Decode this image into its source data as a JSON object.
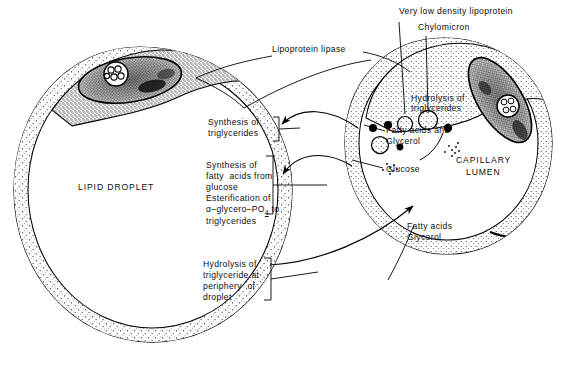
{
  "figure": {
    "title_visible": false,
    "background_color": "#ffffff",
    "ink_color": "#000000"
  },
  "structures": {
    "lipid_droplet": {
      "label": "LIPID DROPLET",
      "description": "adipocyte with large lipid droplet"
    },
    "capillary": {
      "label_line1": "CAPILLARY",
      "label_line2": "LUMEN"
    }
  },
  "callouts": {
    "lipoprotein_lipase": "Lipoprotein lipase",
    "vldl": "Very low density lipoprotein",
    "chylomicron": "Chylomicron",
    "hydrolysis_tg_cap_line1": "Hydrolysis of",
    "hydrolysis_tg_cap_line2": "triglycerides",
    "fatty_acids_and_line1": "Fatty acids and",
    "fatty_acids_and_line2": "Glycerol",
    "glucose": "Glucose",
    "fatty_acids_line1": "Fatty acids",
    "fatty_acids_line2": "Glycerol"
  },
  "bracket_blocks": [
    {
      "id": "synthesis-triglycerides",
      "lines": [
        "Synthesis of",
        "triglycerides"
      ]
    },
    {
      "id": "synthesis-fatty-acids",
      "lines": [
        "Synthesis of",
        "fatty  acids from",
        "glucose",
        "Esterification of",
        "α–glycero–PO4 to",
        "triglycerides"
      ],
      "formula_prefix": "α–glycero–PO",
      "formula_subscript": "4",
      "formula_suffix": " to"
    },
    {
      "id": "hydrolysis-periphery",
      "lines": [
        "Hydrolysis of",
        "triglyceride at",
        "periphery  of",
        "droplet"
      ]
    }
  ]
}
